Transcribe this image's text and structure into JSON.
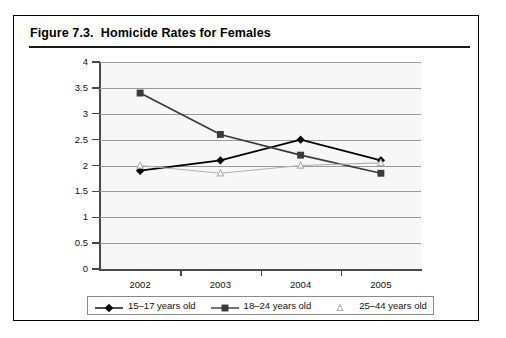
{
  "figure": {
    "label": "Figure 7.3.",
    "title": "Homicide Rates for Females",
    "full_title": "Figure 7.3.  Homicide Rates for Females"
  },
  "chart_data": {
    "type": "line",
    "title": "Homicide Rates for Females",
    "xlabel": "",
    "ylabel": "",
    "categories": [
      "2002",
      "2003",
      "2004",
      "2005"
    ],
    "x": [
      2002,
      2003,
      2004,
      2005
    ],
    "ylim": [
      0,
      4
    ],
    "ytick_labels": [
      "0",
      "0.5",
      "1",
      "1.5",
      "2",
      "2.5",
      "3",
      "3.5",
      "4"
    ],
    "ytick_values": [
      0,
      0.5,
      1,
      1.5,
      2,
      2.5,
      3,
      3.5,
      4
    ],
    "grid": true,
    "legend_position": "bottom",
    "series": [
      {
        "name": "15–17 years old",
        "marker": "filled-diamond",
        "color": "#000000",
        "values": [
          1.9,
          2.1,
          2.5,
          2.1
        ]
      },
      {
        "name": "18–24 years old",
        "marker": "filled-square",
        "color": "#3a3a3a",
        "values": [
          3.4,
          2.6,
          2.2,
          1.85
        ]
      },
      {
        "name": "25–44 years old",
        "marker": "open-triangle",
        "color": "#b0b0b0",
        "values": [
          2.0,
          1.85,
          2.0,
          2.05
        ]
      }
    ]
  },
  "legend": {
    "items": [
      {
        "label": "15–17 years old",
        "marker": "filled-diamond"
      },
      {
        "label": "18–24 years old",
        "marker": "filled-square"
      },
      {
        "label": "25–44 years old",
        "marker": "open-triangle"
      }
    ]
  }
}
